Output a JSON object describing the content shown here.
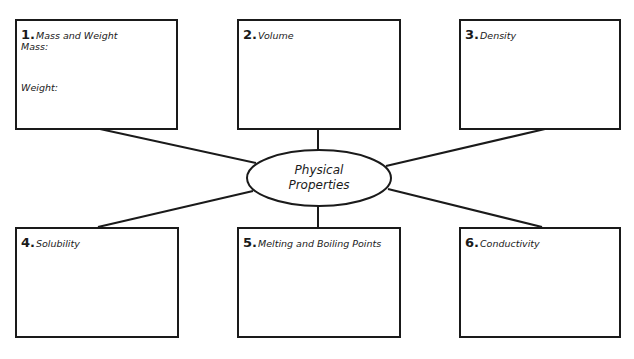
{
  "diagram": {
    "type": "concept-map",
    "center": {
      "line1": "Physical",
      "line2": "Properties"
    },
    "boxes": [
      {
        "num": "1.",
        "label": "Mass and Weight",
        "subfields": [
          "Mass:",
          "Weight:"
        ]
      },
      {
        "num": "2.",
        "label": "Volume"
      },
      {
        "num": "3.",
        "label": "Density"
      },
      {
        "num": "4.",
        "label": "Solubility"
      },
      {
        "num": "5.",
        "label": "Melting and Boiling Points"
      },
      {
        "num": "6.",
        "label": "Conductivity"
      }
    ],
    "colors": {
      "stroke": "#1a1a1a",
      "background": "#ffffff"
    }
  }
}
